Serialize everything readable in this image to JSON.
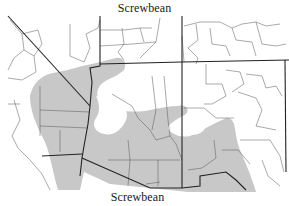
{
  "map": {
    "title_top": "Screwbean",
    "title_bottom": "Screwbean",
    "subject": "Screwbean mesquite range",
    "region": "Southwestern United States",
    "range_fill_color": "#c8c8c8",
    "boundary_color": "#222222"
  }
}
